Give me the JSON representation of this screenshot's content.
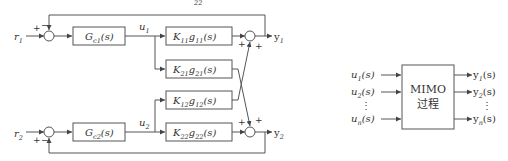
{
  "left_diagram": {
    "title_fragment": "22",
    "inputs": [
      {
        "name": "r",
        "sub": "1"
      },
      {
        "name": "r",
        "sub": "2"
      }
    ],
    "controllers": [
      {
        "name": "G",
        "sub": "c1",
        "arg": "(s)"
      },
      {
        "name": "G",
        "sub": "c2",
        "arg": "(s)"
      }
    ],
    "controller_outputs": [
      {
        "name": "u",
        "sub": "1"
      },
      {
        "name": "u",
        "sub": "2"
      }
    ],
    "plant_blocks": [
      {
        "k": "K",
        "ksub": "11",
        "g": "g",
        "gsub": "11",
        "arg": "(s)"
      },
      {
        "k": "K",
        "ksub": "21",
        "g": "g",
        "gsub": "21",
        "arg": "(s)"
      },
      {
        "k": "K",
        "ksub": "12",
        "g": "g",
        "gsub": "12",
        "arg": "(s)"
      },
      {
        "k": "K",
        "ksub": "22",
        "g": "g",
        "gsub": "22",
        "arg": "(s)"
      }
    ],
    "outputs": [
      {
        "name": "y",
        "sub": "1"
      },
      {
        "name": "y",
        "sub": "2"
      }
    ],
    "signs": {
      "err1_ref": "+",
      "err1_fb": "−",
      "err2_ref": "+",
      "err2_fb": "−",
      "sum1_a": "+",
      "sum1_b": "+",
      "sum2_a": "+",
      "sum2_b": "+"
    }
  },
  "right_diagram": {
    "block_line1": "MIMO",
    "block_line2": "过程",
    "inputs": [
      {
        "name": "u",
        "sub": "1",
        "arg": "(s)"
      },
      {
        "name": "u",
        "sub": "2",
        "arg": "(s)"
      },
      {
        "name": "u",
        "sub": "n",
        "arg": "(s)"
      }
    ],
    "outputs": [
      {
        "name": "y",
        "sub": "1",
        "arg": "(s)"
      },
      {
        "name": "y",
        "sub": "2",
        "arg": "(s)"
      },
      {
        "name": "y",
        "sub": "n",
        "arg": "(s)"
      }
    ],
    "ellipsis": "⋮"
  }
}
